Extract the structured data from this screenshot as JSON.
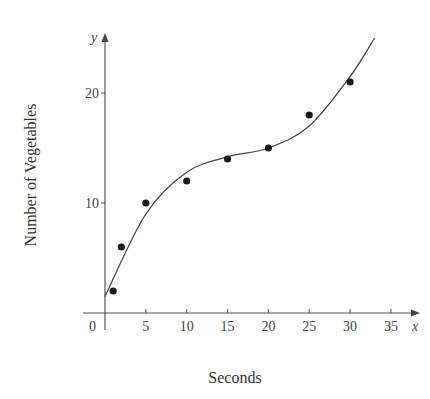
{
  "chart_data": {
    "type": "scatter",
    "xlabel": "Seconds",
    "ylabel": "Number of Vegetables",
    "x_axis_symbol": "x",
    "y_axis_symbol": "y",
    "origin_label": "0",
    "x_ticks": [
      5,
      10,
      15,
      20,
      25,
      30,
      35
    ],
    "y_ticks": [
      10,
      20
    ],
    "xlim": [
      0,
      38
    ],
    "ylim": [
      0,
      25
    ],
    "grid": false,
    "legend": null,
    "series": [
      {
        "name": "data points",
        "kind": "scatter",
        "x": [
          1,
          2,
          5,
          10,
          15,
          20,
          25,
          30
        ],
        "y": [
          2,
          6,
          10,
          12,
          14,
          15,
          18,
          21
        ]
      },
      {
        "name": "fitted cubic curve",
        "kind": "line",
        "x": [
          0,
          5,
          10,
          15,
          20,
          25,
          30,
          33
        ],
        "y": [
          1.5,
          9,
          12.8,
          14.2,
          15,
          17,
          21.5,
          25
        ]
      }
    ]
  },
  "labels": {
    "title": "",
    "xlabel": "Seconds",
    "ylabel": "Number of Vegetables"
  }
}
